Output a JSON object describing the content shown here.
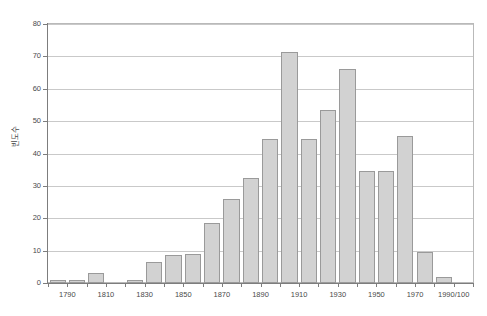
{
  "chart_data": {
    "type": "bar",
    "title": "",
    "xlabel": "",
    "ylabel": "빈도수",
    "ylim": [
      0,
      80
    ],
    "ytick_values": [
      0,
      10,
      20,
      30,
      40,
      50,
      60,
      70,
      80
    ],
    "ytick_labels": [
      "0",
      "10",
      "20",
      "30",
      "40",
      "50",
      "60",
      "70",
      "80"
    ],
    "grid": true,
    "legend": "none",
    "bar_fill_color": "#d2d2d2",
    "bar_edge_color": "#9a9a9a",
    "grid_color": "#c9c9c9",
    "axis_color": "#7d7d7d",
    "xtick_labels": [
      "1790",
      "1810",
      "1830",
      "1850",
      "1870",
      "1890",
      "1910",
      "1930",
      "1950",
      "1970",
      "1990/100"
    ],
    "categories": [
      "1780",
      "1790",
      "1800",
      "1810",
      "1820",
      "1830",
      "1840",
      "1850",
      "1860",
      "1870",
      "1880",
      "1890",
      "1900",
      "1910",
      "1920",
      "1930",
      "1940",
      "1950",
      "1960",
      "1970",
      "1980",
      "1990/100"
    ],
    "values": [
      1,
      1,
      3,
      0,
      1,
      6.5,
      8.5,
      9,
      18.5,
      26,
      32.5,
      44.5,
      71.5,
      44.5,
      53.5,
      66,
      34.5,
      34.5,
      45.5,
      9.5,
      2,
      0
    ]
  }
}
